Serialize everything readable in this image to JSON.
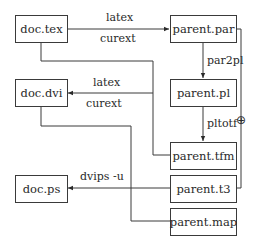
{
  "diagram": {
    "nodes": {
      "doc_tex": "doc.tex",
      "doc_dvi": "doc.dvi",
      "doc_ps": "doc.ps",
      "parent_par": "parent.par",
      "parent_pl": "parent.pl",
      "parent_tfm": "parent.tfm",
      "parent_t3": "parent.t3",
      "parent_map": "parent.map"
    },
    "edges": {
      "tex_to_par_top": "latex",
      "tex_to_par_bottom": "curext",
      "par_to_pl": "par2pl",
      "pl_to_tfm": "pltotf",
      "to_dvi_top": "latex",
      "to_dvi_bottom": "curext",
      "t3_to_ps": "dvips -u",
      "junction_symbol": "⊕"
    }
  }
}
